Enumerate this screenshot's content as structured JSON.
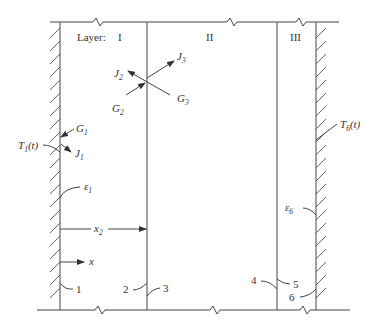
{
  "diagram": {
    "layers_label": "Layer:",
    "layers": [
      "I",
      "II",
      "III"
    ],
    "left_wall": {
      "temperature": {
        "base": "T",
        "sub": "1",
        "arg": "(t)"
      },
      "emissivity": {
        "base": "ε",
        "sub": "1"
      }
    },
    "right_wall": {
      "temperature": {
        "base": "T",
        "sub": "6",
        "arg": "(t)"
      },
      "emissivity": {
        "base": "ε",
        "sub": "6"
      }
    },
    "fluxes": {
      "G1": {
        "base": "G",
        "sub": "1"
      },
      "J1": {
        "base": "J",
        "sub": "1"
      },
      "G2": {
        "base": "G",
        "sub": "2"
      },
      "J2": {
        "base": "J",
        "sub": "2"
      },
      "G3": {
        "base": "G",
        "sub": "3"
      },
      "J3": {
        "base": "J",
        "sub": "3"
      }
    },
    "dimension_x2": {
      "base": "x",
      "sub": "2"
    },
    "axis_x": "x",
    "surface_numbers": [
      "1",
      "2",
      "3",
      "4",
      "5",
      "6"
    ]
  }
}
